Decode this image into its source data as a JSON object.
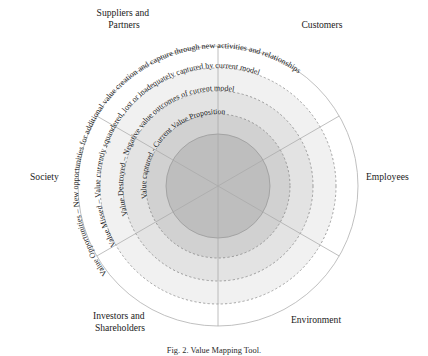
{
  "figure": {
    "title_caption": "Fig. 2. Value Mapping Tool.",
    "center": {
      "cx": 218,
      "cy": 186
    },
    "colors": {
      "ring_opportunities_fill": "#ffffff",
      "ring_missed_fill": "#f0f0f0",
      "ring_destroyed_fill": "#e2e2e2",
      "ring_captured_fill": "#d0d0d0",
      "ring_core_fill": "#bdbdbd",
      "outer_stroke": "#b8b8b8",
      "dashed_stroke": "#8e8e8e",
      "spoke_stroke": "#aaaaaa",
      "text": "#1a1a1a"
    },
    "rings": [
      {
        "id": "value-opportunities",
        "short_label": "Value Opportunities",
        "label": "Value Opportunities – New opportunities for additional value creation and capture through new activities and  relationships",
        "radius": 140,
        "fill": "#ffffff",
        "border": "solid"
      },
      {
        "id": "value-missed",
        "short_label": "Value Missed",
        "label": "Value Missed – Value currently squandered, lost or inadequately captured by current model",
        "radius": 118,
        "fill": "#f0f0f0",
        "border": "dashed"
      },
      {
        "id": "value-destroyed",
        "short_label": "Value Destroyed",
        "label": "Value Destroyed – Negative value outcomes of current model",
        "radius": 95,
        "fill": "#e2e2e2",
        "border": "dashed"
      },
      {
        "id": "value-captured",
        "short_label": "Value Captured",
        "label": "Value captured - Current Value Proposition",
        "radius": 72,
        "fill": "#d0d0d0",
        "border": "dashed"
      },
      {
        "id": "core",
        "short_label": "",
        "label": "",
        "radius": 52,
        "fill": "#bdbdbd",
        "border": "solid"
      }
    ],
    "stakeholders": [
      {
        "id": "suppliers-and-partners",
        "lines": [
          "Suppliers and",
          "Partners"
        ],
        "x": 124,
        "y": 16,
        "anchor": "middle"
      },
      {
        "id": "customers",
        "lines": [
          "Customers"
        ],
        "x": 322,
        "y": 28,
        "anchor": "middle"
      },
      {
        "id": "society",
        "lines": [
          "Society"
        ],
        "x": 30,
        "y": 180,
        "anchor": "start"
      },
      {
        "id": "employees",
        "lines": [
          "Employees"
        ],
        "x": 366,
        "y": 180,
        "anchor": "start"
      },
      {
        "id": "investors-and-shareholders",
        "lines": [
          "Investors and",
          "Shareholders"
        ],
        "x": 120,
        "y": 319,
        "anchor": "middle"
      },
      {
        "id": "environment",
        "lines": [
          "Environment"
        ],
        "x": 316,
        "y": 323,
        "anchor": "middle"
      }
    ],
    "spokes": [
      {
        "id": "spoke-top",
        "angle_deg": 270
      },
      {
        "id": "spoke-upper-right",
        "angle_deg": 330
      },
      {
        "id": "spoke-lower-right",
        "angle_deg": 30
      },
      {
        "id": "spoke-bottom",
        "angle_deg": 90
      },
      {
        "id": "spoke-lower-left",
        "angle_deg": 150
      },
      {
        "id": "spoke-upper-left",
        "angle_deg": 210
      }
    ]
  }
}
